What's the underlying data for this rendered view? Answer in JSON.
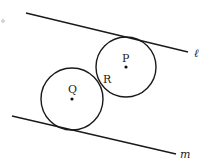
{
  "diagram": {
    "colors": {
      "stroke": "#1a1a1a",
      "background": "#ffffff",
      "marker": "#aaaaaa"
    },
    "lines": [
      {
        "name": "ℓ",
        "x1": 26,
        "y1": 13,
        "x2": 188,
        "y2": 52,
        "label": "ℓ",
        "label_x": 194,
        "label_y": 57
      },
      {
        "name": "m",
        "x1": 12,
        "y1": 116,
        "x2": 176,
        "y2": 154,
        "label": "m",
        "label_x": 180,
        "label_y": 158
      }
    ],
    "circles": [
      {
        "name": "P",
        "cx": 126,
        "cy": 67,
        "r": 30,
        "label": "P",
        "label_x": 122,
        "label_y": 62
      },
      {
        "name": "Q",
        "cx": 72,
        "cy": 99,
        "r": 31,
        "label": "Q",
        "label_x": 68,
        "label_y": 93
      }
    ],
    "points": [
      {
        "name": "R",
        "x": 98,
        "y": 82,
        "label": "R",
        "label_x": 103,
        "label_y": 83
      }
    ],
    "corner_marker": {
      "cx": 3,
      "cy": 21,
      "r": 1.3
    }
  }
}
